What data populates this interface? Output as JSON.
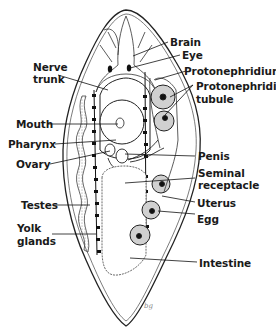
{
  "diagram": {
    "colors": {
      "ink": "#1a1a1a",
      "stipple": "#555555",
      "fill": "#ffffff",
      "organ_fill": "#d8d8d8"
    },
    "labels_right": [
      {
        "id": "brain",
        "text": "Brain"
      },
      {
        "id": "eye",
        "text": "Eye"
      },
      {
        "id": "protonephridium",
        "text": "Protonephridium"
      },
      {
        "id": "protonephridial-tubule-1",
        "text": "Protonephridial"
      },
      {
        "id": "protonephridial-tubule-2",
        "text": "tubule"
      },
      {
        "id": "penis",
        "text": "Penis"
      },
      {
        "id": "seminal-receptacle-1",
        "text": "Seminal"
      },
      {
        "id": "seminal-receptacle-2",
        "text": "receptacle"
      },
      {
        "id": "uterus",
        "text": "Uterus"
      },
      {
        "id": "egg",
        "text": "Egg"
      },
      {
        "id": "intestine",
        "text": "Intestine"
      }
    ],
    "labels_left": [
      {
        "id": "nerve-trunk-1",
        "text": "Nerve"
      },
      {
        "id": "nerve-trunk-2",
        "text": "trunk"
      },
      {
        "id": "mouth",
        "text": "Mouth"
      },
      {
        "id": "pharynx",
        "text": "Pharynx"
      },
      {
        "id": "ovary",
        "text": "Ovary"
      },
      {
        "id": "testes",
        "text": "Testes"
      },
      {
        "id": "yolk-glands-1",
        "text": "Yolk"
      },
      {
        "id": "yolk-glands-2",
        "text": "glands"
      }
    ],
    "signature": "bg"
  }
}
